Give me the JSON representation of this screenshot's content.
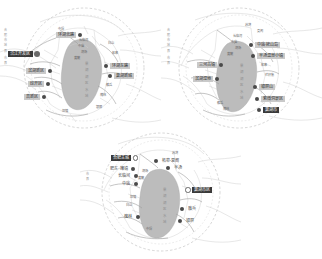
{
  "figure": {
    "background": "#ffffff",
    "panel_count": 3,
    "accent_dark": "#3a3a3a",
    "accent_gray": "#c9c9c9",
    "lake_fill": "#b9b9b9",
    "road_color": "#9a9a9a",
    "boundary_style": "dashed-circle"
  },
  "panels": [
    {
      "id": "panel-a",
      "position": "top-left",
      "highlight_label": {
        "text": "沿江开发区",
        "style": "dark",
        "marker": "big-dot"
      },
      "labels": [
        {
          "text": "环湖北路",
          "style": "gray",
          "marker": "dot",
          "side": "right"
        },
        {
          "text": "滨湖新区",
          "style": "gray",
          "marker": "dot",
          "side": "left"
        },
        {
          "text": "经开区",
          "style": "gray",
          "marker": "dot",
          "side": "left"
        },
        {
          "text": "高新区",
          "style": "gray",
          "marker": "dot",
          "side": "left"
        },
        {
          "text": "环湖东路",
          "style": "gray",
          "marker": "dot",
          "side": "right"
        },
        {
          "text": "巢湖新城",
          "style": "gray",
          "marker": "dot",
          "side": "right"
        }
      ],
      "places": [
        "长临河",
        "中庙",
        "烔炀",
        "黄麓",
        "散兵",
        "槐林",
        "白山",
        "柘皋",
        "银屏",
        "坝镇",
        "中垾"
      ],
      "lake_label": "巢 湖 湖 区 水 域"
    },
    {
      "id": "panel-b",
      "position": "top-right",
      "highlight_label": {
        "text": "巢湖市",
        "style": "dark",
        "marker": "dot"
      },
      "labels": [
        {
          "text": "中庙·姥山岛",
          "style": "gray",
          "marker": "dot",
          "side": "right"
        },
        {
          "text": "半汤温泉小镇",
          "style": "gray",
          "marker": "dot",
          "side": "right"
        },
        {
          "text": "三河古镇",
          "style": "gray",
          "marker": "dot",
          "side": "left"
        },
        {
          "text": "滨湖湿地",
          "style": "gray",
          "marker": "dot",
          "side": "left"
        },
        {
          "text": "银屏山",
          "style": "gray",
          "marker": "dot",
          "side": "right"
        },
        {
          "text": "紫微洞景区",
          "style": "gray",
          "marker": "dot",
          "side": "right"
        }
      ],
      "places": [
        "长临河",
        "中庙",
        "烔炀",
        "黄麓",
        "散兵",
        "槐林",
        "柘皋",
        "夏阁",
        "苏湾",
        "栏杆集"
      ],
      "lake_label": "巢 湖 湖 区 水 域"
    },
    {
      "id": "panel-c",
      "position": "bottom-center",
      "highlight_label": {
        "text": "合肥主城",
        "style": "dark",
        "marker": "ring"
      },
      "labels": [
        {
          "text": "巢湖市区",
          "style": "dark",
          "marker": "ring",
          "side": "right"
        },
        {
          "text": "肥东·撮镇",
          "style": "plain",
          "marker": "dot",
          "side": "left"
        },
        {
          "text": "长临河",
          "style": "plain",
          "marker": "dot",
          "side": "left"
        },
        {
          "text": "中庙",
          "style": "plain",
          "marker": "dot",
          "side": "left"
        },
        {
          "text": "柘皋·夏阁",
          "style": "plain",
          "marker": "dot",
          "side": "right"
        },
        {
          "text": "半汤",
          "style": "plain",
          "marker": "dot",
          "side": "right"
        },
        {
          "text": "槐林",
          "style": "plain",
          "marker": "dot",
          "side": "left"
        },
        {
          "text": "散兵",
          "style": "plain",
          "marker": "dot",
          "side": "right"
        },
        {
          "text": "银屏",
          "style": "plain",
          "marker": "dot",
          "side": "right"
        }
      ],
      "places": [
        "烔炀",
        "黄麓",
        "坝镇",
        "白山",
        "中垾",
        "苏湾"
      ],
      "lake_label": "巢 湖 湖 区 水 域"
    }
  ],
  "edge_notes": [
    "合 肥 市 域 界",
    "市 界"
  ]
}
